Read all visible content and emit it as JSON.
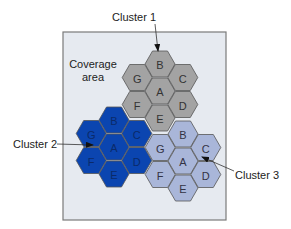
{
  "coverage_area": {
    "label_line1": "Coverage",
    "label_line2": "area",
    "box": {
      "x": 63,
      "y": 32,
      "w": 163,
      "h": 188
    },
    "fill": "#e6eaf0",
    "stroke": "#7a7a7a"
  },
  "grid": {
    "col_step": 22.8,
    "row_step": 27,
    "radius": 15,
    "cell_stroke": "#555555"
  },
  "cell_offsets": {
    "A": [
      0,
      0
    ],
    "B": [
      0,
      -1
    ],
    "C": [
      1,
      -0.5
    ],
    "D": [
      1,
      0.5
    ],
    "E": [
      0,
      1
    ],
    "F": [
      -1,
      0.5
    ],
    "G": [
      -1,
      -0.5
    ]
  },
  "clusters": [
    {
      "name": "Cluster 1",
      "center": [
        160,
        91
      ],
      "fill": "#a3a3a3",
      "text_color": "#333333",
      "cells": [
        "A",
        "B",
        "C",
        "D",
        "E",
        "F",
        "G"
      ],
      "callout": {
        "text_x": 112,
        "text_y": 21,
        "line": [
          [
            155,
            24
          ],
          [
            158,
            51
          ]
        ]
      }
    },
    {
      "name": "Cluster 2",
      "center": [
        114,
        147
      ],
      "fill": "#0b45b0",
      "text_color": "#0a2a6a",
      "cells": [
        "A",
        "B",
        "C",
        "D",
        "E",
        "F",
        "G"
      ],
      "callout": {
        "text_x": 13,
        "text_y": 148,
        "line": [
          [
            57,
            144
          ],
          [
            93,
            145
          ]
        ]
      }
    },
    {
      "name": "Cluster 3",
      "center": [
        183,
        161
      ],
      "fill": "#a9b6d9",
      "text_color": "#333344",
      "cells": [
        "A",
        "B",
        "C",
        "D",
        "E",
        "F",
        "G"
      ],
      "callout": {
        "text_x": 235,
        "text_y": 179,
        "line": [
          [
            234,
            171
          ],
          [
            202,
            157
          ]
        ]
      }
    }
  ]
}
